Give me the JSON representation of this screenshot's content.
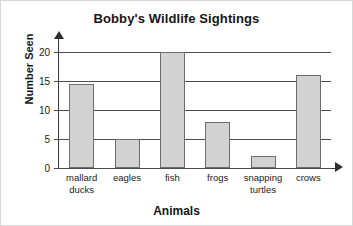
{
  "chart_data": {
    "type": "bar",
    "title": "Bobby's Wildlife Sightings",
    "xlabel": "Animals",
    "ylabel": "Number Seen",
    "categories": [
      "mallard ducks",
      "eagles",
      "fish",
      "frogs",
      "snapping turtles",
      "crows"
    ],
    "category_lines": [
      [
        "mallard",
        "ducks"
      ],
      [
        "eagles"
      ],
      [
        "fish"
      ],
      [
        "frogs"
      ],
      [
        "snapping",
        "turtles"
      ],
      [
        "crows"
      ]
    ],
    "values": [
      14.5,
      5,
      20,
      8,
      2,
      16
    ],
    "ylim": [
      0,
      20
    ],
    "yticks": [
      0,
      5,
      10,
      15,
      20
    ],
    "ytick_labels": [
      "0",
      "5",
      "10",
      "15",
      "20"
    ],
    "grid": true,
    "legend": "none",
    "bar_fill_color": "#d2d2d2",
    "bar_edge_color": "#6e6e6e",
    "axis_color": "#3a3a3a",
    "grid_color": "#4d4d4d"
  }
}
